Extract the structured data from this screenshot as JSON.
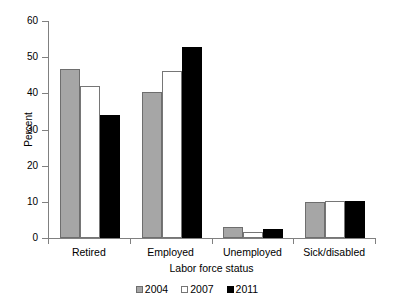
{
  "chart_data": {
    "type": "bar",
    "title": "",
    "subtitle": "",
    "xlabel": "Labor force status",
    "ylabel": "Percent",
    "categories": [
      "Retired",
      "Employed",
      "Unemployed",
      "Sick/disabled"
    ],
    "series": [
      {
        "name": "2004",
        "values": [
          46.8,
          40.3,
          3.0,
          10.0
        ],
        "color": "#a6a6a6"
      },
      {
        "name": "2007",
        "values": [
          42.1,
          46.1,
          1.7,
          10.1
        ],
        "color": "#ffffff"
      },
      {
        "name": "2011",
        "values": [
          34.1,
          52.9,
          2.6,
          10.3
        ],
        "color": "#000000"
      }
    ],
    "ylim": [
      0,
      60
    ],
    "ytick_step": 10,
    "ytick_labels": [
      "0",
      "10",
      "20",
      "30",
      "40",
      "50",
      "60"
    ],
    "grid": false,
    "legend_position": "bottom",
    "legend_entries": [
      "2004",
      "2007",
      "2011"
    ],
    "annotations": []
  }
}
